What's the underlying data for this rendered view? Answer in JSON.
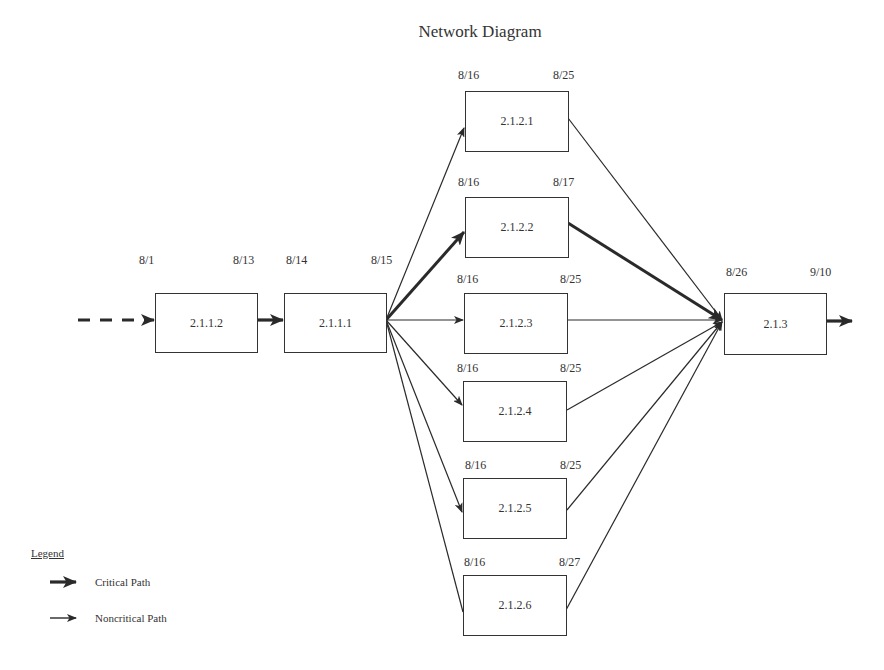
{
  "title": "Network Diagram",
  "nodes": [
    {
      "id": "2.1.1.2",
      "start": "8/1",
      "finish": "8/13"
    },
    {
      "id": "2.1.1.1",
      "start": "8/14",
      "finish": "8/15"
    },
    {
      "id": "2.1.2.1",
      "start": "8/16",
      "finish": "8/25"
    },
    {
      "id": "2.1.2.2",
      "start": "8/16",
      "finish": "8/17"
    },
    {
      "id": "2.1.2.3",
      "start": "8/16",
      "finish": "8/25"
    },
    {
      "id": "2.1.2.4",
      "start": "8/16",
      "finish": "8/25"
    },
    {
      "id": "2.1.2.5",
      "start": "8/16",
      "finish": "8/25"
    },
    {
      "id": "2.1.2.6",
      "start": "8/16",
      "finish": "8/27"
    },
    {
      "id": "2.1.3",
      "start": "8/26",
      "finish": "9/10"
    }
  ],
  "edges": [
    {
      "from": "(prior)",
      "to": "2.1.1.2",
      "type": "dashed-critical"
    },
    {
      "from": "2.1.1.2",
      "to": "2.1.1.1",
      "type": "critical"
    },
    {
      "from": "2.1.1.1",
      "to": "2.1.2.1",
      "type": "noncritical"
    },
    {
      "from": "2.1.1.1",
      "to": "2.1.2.2",
      "type": "critical"
    },
    {
      "from": "2.1.1.1",
      "to": "2.1.2.3",
      "type": "noncritical"
    },
    {
      "from": "2.1.1.1",
      "to": "2.1.2.4",
      "type": "noncritical"
    },
    {
      "from": "2.1.1.1",
      "to": "2.1.2.5",
      "type": "noncritical"
    },
    {
      "from": "2.1.1.1",
      "to": "2.1.2.6",
      "type": "noncritical"
    },
    {
      "from": "2.1.2.1",
      "to": "2.1.3",
      "type": "noncritical"
    },
    {
      "from": "2.1.2.2",
      "to": "2.1.3",
      "type": "critical"
    },
    {
      "from": "2.1.2.3",
      "to": "2.1.3",
      "type": "noncritical"
    },
    {
      "from": "2.1.2.4",
      "to": "2.1.3",
      "type": "noncritical"
    },
    {
      "from": "2.1.2.5",
      "to": "2.1.3",
      "type": "noncritical"
    },
    {
      "from": "2.1.2.6",
      "to": "2.1.3",
      "type": "noncritical"
    },
    {
      "from": "2.1.3",
      "to": "(next)",
      "type": "critical"
    }
  ],
  "legend": {
    "title": "Legend",
    "items": [
      {
        "label": "Critical Path",
        "style": "thick-arrow"
      },
      {
        "label": "Noncritical Path",
        "style": "thin-arrow"
      }
    ]
  },
  "colors": {
    "line": "#2a2a2a",
    "text": "#333333",
    "background": "#ffffff"
  }
}
